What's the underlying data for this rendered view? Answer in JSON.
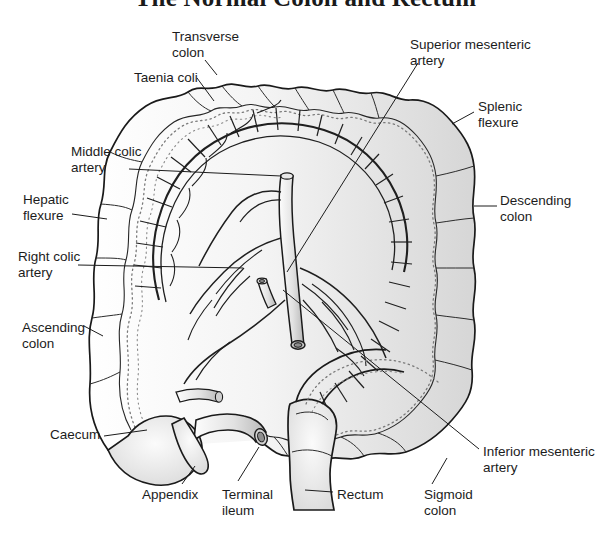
{
  "figure": {
    "title": "The Normal Colon and Rectum",
    "type": "anatomical-line-diagram",
    "background_color": "#ffffff",
    "line_color": "#1a1a1a",
    "fill_color": "#f2f2f2",
    "shade_color": "#d9d9d9",
    "text_color": "#1c1c1c"
  },
  "labels": [
    {
      "id": "transverse-colon",
      "text": "Transverse\ncolon",
      "x": 172,
      "y": 29,
      "align": "left"
    },
    {
      "id": "taenia-coli",
      "text": "Taenia coli",
      "x": 134,
      "y": 70,
      "align": "left"
    },
    {
      "id": "middle-colic-artery",
      "text": "Middle colic\nartery",
      "x": 71,
      "y": 144,
      "align": "left"
    },
    {
      "id": "hepatic-flexure",
      "text": "Hepatic\nflexure",
      "x": 23,
      "y": 192,
      "align": "left"
    },
    {
      "id": "right-colic-artery",
      "text": "Right colic\nartery",
      "x": 18,
      "y": 249,
      "align": "left"
    },
    {
      "id": "ascending-colon",
      "text": "Ascending\ncolon",
      "x": 22,
      "y": 320,
      "align": "left"
    },
    {
      "id": "caecum",
      "text": "Caecum",
      "x": 50,
      "y": 427,
      "align": "left"
    },
    {
      "id": "appendix",
      "text": "Appendix",
      "x": 142,
      "y": 487,
      "align": "left"
    },
    {
      "id": "terminal-ileum",
      "text": "Terminal\nileum",
      "x": 222,
      "y": 487,
      "align": "left"
    },
    {
      "id": "rectum",
      "text": "Rectum",
      "x": 337,
      "y": 487,
      "align": "left"
    },
    {
      "id": "sigmoid-colon",
      "text": "Sigmoid\ncolon",
      "x": 424,
      "y": 487,
      "align": "left"
    },
    {
      "id": "inferior-mesenteric-artery",
      "text": "Inferior mesenteric\nartery",
      "x": 483,
      "y": 444,
      "align": "left"
    },
    {
      "id": "descending-colon",
      "text": "Descending\ncolon",
      "x": 500,
      "y": 193,
      "align": "left"
    },
    {
      "id": "splenic-flexure",
      "text": "Splenic\nflexure",
      "x": 478,
      "y": 99,
      "align": "left"
    },
    {
      "id": "superior-mesenteric-artery",
      "text": "Superior mesenteric\nartery",
      "x": 410,
      "y": 37,
      "align": "left"
    }
  ],
  "leader_lines": [
    {
      "id": "leader-transverse-colon",
      "points": "205,60 217,75"
    },
    {
      "id": "leader-taenia-coli",
      "points": "197,78 214,101"
    },
    {
      "id": "leader-middle-colic-artery",
      "points": "129,169 281,176"
    },
    {
      "id": "leader-hepatic-flexure",
      "points": "72,214 107,219"
    },
    {
      "id": "leader-right-colic-artery",
      "points": "78,265 243,268"
    },
    {
      "id": "leader-ascending-colon",
      "points": "84,326 103,336"
    },
    {
      "id": "leader-caecum",
      "points": "104,436 147,430"
    },
    {
      "id": "leader-appendix",
      "points": "182,484 195,466"
    },
    {
      "id": "leader-terminal-ileum",
      "points": "238,481 259,447"
    },
    {
      "id": "leader-rectum",
      "points": "333,492 305,490"
    },
    {
      "id": "leader-sigmoid-colon",
      "points": "432,484 447,458"
    },
    {
      "id": "leader-inferior-mesenteric-artery",
      "points": "479,449 283,290"
    },
    {
      "id": "leader-descending-colon",
      "points": "497,206 474,206"
    },
    {
      "id": "leader-splenic-flexure",
      "points": "474,112 452,124"
    },
    {
      "id": "leader-superior-mesenteric-artery",
      "points": "418,63 287,272"
    }
  ]
}
